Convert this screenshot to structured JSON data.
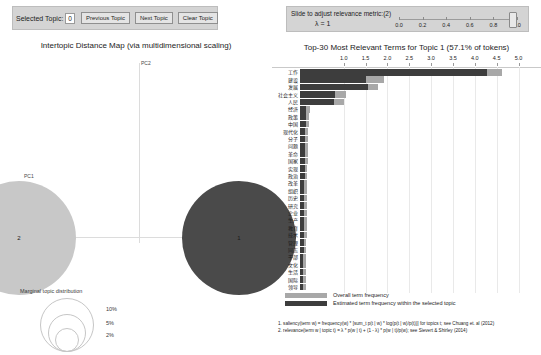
{
  "controls": {
    "selected_topic_label": "Selected Topic:",
    "selected_topic_value": "0",
    "previous_topic": "Previous Topic",
    "next_topic": "Next Topic",
    "clear_topic": "Clear Topic"
  },
  "slider": {
    "title": "Slide to adjust relevance metric:(2)",
    "lambda_label": "λ = 1",
    "ticks": [
      "0.0",
      "0.2",
      "0.4",
      "0.6",
      "0.8",
      "1.0"
    ],
    "value": 1.0
  },
  "mds": {
    "title": "Intertopic Distance Map (via multidimensional scaling)",
    "x_axis_label": "PC1",
    "y_axis_label": "PC2",
    "topics": [
      {
        "id": "2",
        "cx": -120,
        "cy": 128,
        "r": 57,
        "color": "#c8c8c8",
        "selected": false
      },
      {
        "id": "1",
        "cx": 100,
        "cy": 128,
        "r": 57,
        "color": "#4a4a4a",
        "selected": true
      }
    ],
    "marginal_legend": {
      "title": "Marginal topic distribution",
      "sizes": [
        "2%",
        "5%",
        "10%"
      ]
    }
  },
  "bars": {
    "title": "Top-30 Most Relevant Terms for Topic 1 (57.1% of tokens)",
    "x_ticks": [
      "1.0",
      "1.5",
      "2.0",
      "2.5",
      "3.0",
      "3.5",
      "4.0",
      "4.5",
      "5.0"
    ],
    "x_min": 0,
    "x_max": 5.4,
    "colors": {
      "overall": "#a8a8a8",
      "topic": "#3d3d3d"
    },
    "legend": [
      {
        "label": "Overall term frequency",
        "color": "#a8a8a8"
      },
      {
        "label": "Estimated term frequency within the selected topic",
        "color": "#3d3d3d"
      }
    ],
    "terms": [
      {
        "term": "工作",
        "overall": 4.62,
        "topic": 4.28
      },
      {
        "term": "建设",
        "overall": 1.92,
        "topic": 1.52
      },
      {
        "term": "发展",
        "overall": 1.78,
        "topic": 1.55
      },
      {
        "term": "社会主义",
        "overall": 1.05,
        "topic": 0.8
      },
      {
        "term": "人民",
        "overall": 1.0,
        "topic": 0.78
      },
      {
        "term": "经济",
        "overall": 0.22,
        "topic": 0.14
      },
      {
        "term": "政策",
        "overall": 0.21,
        "topic": 0.13
      },
      {
        "term": "中国",
        "overall": 0.2,
        "topic": 0.13
      },
      {
        "term": "现代化",
        "overall": 0.19,
        "topic": 0.12
      },
      {
        "term": "分子",
        "overall": 0.19,
        "topic": 0.12
      },
      {
        "term": "问题",
        "overall": 0.18,
        "topic": 0.12
      },
      {
        "term": "革命",
        "overall": 0.18,
        "topic": 0.11
      },
      {
        "term": "国家",
        "overall": 0.18,
        "topic": 0.11
      },
      {
        "term": "实现",
        "overall": 0.17,
        "topic": 0.11
      },
      {
        "term": "政治",
        "overall": 0.17,
        "topic": 0.11
      },
      {
        "term": "改革",
        "overall": 0.17,
        "topic": 0.1
      },
      {
        "term": "组织",
        "overall": 0.16,
        "topic": 0.1
      },
      {
        "term": "历史",
        "overall": 0.16,
        "topic": 0.1
      },
      {
        "term": "研究",
        "overall": 0.16,
        "topic": 0.1
      },
      {
        "term": "企业",
        "overall": 0.15,
        "topic": 0.1
      },
      {
        "term": "生产",
        "overall": 0.15,
        "topic": 0.09
      },
      {
        "term": "教育",
        "overall": 0.15,
        "topic": 0.09
      },
      {
        "term": "技术",
        "overall": 0.15,
        "topic": 0.09
      },
      {
        "term": "管理",
        "overall": 0.14,
        "topic": 0.09
      },
      {
        "term": "同志",
        "overall": 0.14,
        "topic": 0.09
      },
      {
        "term": "干部",
        "overall": 0.14,
        "topic": 0.08
      },
      {
        "term": "文化",
        "overall": 0.14,
        "topic": 0.08
      },
      {
        "term": "生活",
        "overall": 0.13,
        "topic": 0.08
      },
      {
        "term": "国际",
        "overall": 0.13,
        "topic": 0.08
      },
      {
        "term": "领导",
        "overall": 0.13,
        "topic": 0.08
      }
    ]
  },
  "footnotes": {
    "note1": "1. saliency(term w) = frequency(w) * [sum_t p(t | w) * log(p(t | w)/p(t))] for topics t; see Chuang et. al (2012)",
    "note2": "2. relevance(term w | topic t) = λ * p(w | t) + (1 - λ) * p(w | t)/p(w); see Sievert & Shirley (2014)"
  }
}
